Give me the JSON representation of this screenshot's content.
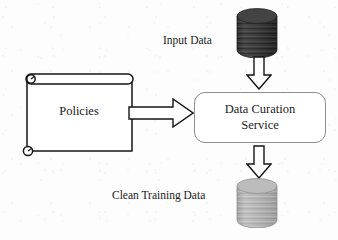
{
  "diagram": {
    "background_color": "#fdfdfd",
    "stroke_color": "#1b1b1b",
    "box_border_color": "#8e8e8e",
    "nodes": {
      "input_data": {
        "label": "Input Data",
        "shape": "cylinder",
        "icon": "database-cylinder-icon",
        "fill_color": "#3a3a3a",
        "texture": "horizontal-bands"
      },
      "policies": {
        "label": "Policies",
        "shape": "scroll-document",
        "icon": "scroll-document-icon",
        "fill_color": "#ffffff"
      },
      "service": {
        "label_line_1": "Data Curation",
        "label_line_2": "Service",
        "shape": "rounded-rectangle",
        "fill_color": "#ffffff",
        "border_color": "#8e8e8e"
      },
      "clean_training_data": {
        "label": "Clean Training Data",
        "shape": "cylinder",
        "icon": "database-cylinder-icon",
        "fill_color": "#b0b0b0",
        "texture": "horizontal-bands"
      }
    },
    "edges": [
      {
        "id": "input-to-service",
        "from": "input_data",
        "to": "service",
        "style": "hollow-block-arrow",
        "direction": "down",
        "icon": "block-arrow-down-icon"
      },
      {
        "id": "policies-to-service",
        "from": "policies",
        "to": "service",
        "style": "hollow-block-arrow",
        "direction": "right",
        "icon": "block-arrow-right-icon"
      },
      {
        "id": "service-to-clean",
        "from": "service",
        "to": "clean_training_data",
        "style": "hollow-block-arrow",
        "direction": "down",
        "icon": "block-arrow-down-icon"
      }
    ]
  }
}
